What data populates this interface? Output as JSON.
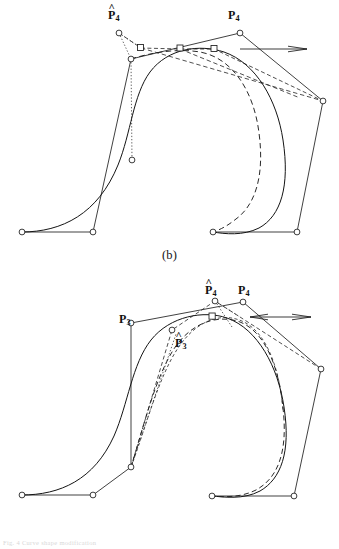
{
  "figure": {
    "background_color": "#ffffff",
    "ink_color": "#1a1a1a",
    "marker_fill": "#ffffff",
    "panels": [
      {
        "id": "b",
        "caption": "(b)",
        "labels": [
          {
            "name": "p4-hat-label",
            "text": "P",
            "subscript": "4",
            "hat": "^",
            "x": 108,
            "y": 9
          },
          {
            "name": "p4-label",
            "text": "P",
            "subscript": "4",
            "hat": "",
            "x": 228,
            "y": 9
          }
        ],
        "annotations": {
          "tangent_arrow": "horizontal-arrow-right",
          "arrow_count": 1
        }
      },
      {
        "id": "c",
        "caption": "(c)",
        "labels": [
          {
            "name": "p4-hat-label",
            "text": "P",
            "subscript": "4",
            "hat": "^",
            "x": 205,
            "y": 284
          },
          {
            "name": "p4-label",
            "text": "P",
            "subscript": "4",
            "hat": "",
            "x": 238,
            "y": 284
          },
          {
            "name": "p3-label",
            "text": "P",
            "subscript": "3",
            "hat": "",
            "x": 119,
            "y": 313
          },
          {
            "name": "p3-hat-label",
            "text": "P",
            "subscript": "3",
            "hat": "^",
            "x": 175,
            "y": 337
          }
        ],
        "annotations": {
          "tangent_arrow": "horizontal-double-arrow-right",
          "arrow_count": 2
        }
      }
    ],
    "footer_text": "Fig. 4 Curve shape modification",
    "legend_semantics": {
      "circle_marker": "control-point-circle",
      "square_marker": "control-point-square",
      "solid_line": "original-curve-and-control-polygon",
      "dashed_line": "modified-curve-and-control-polygon",
      "dotted_line": "displacement-construction-line"
    }
  }
}
